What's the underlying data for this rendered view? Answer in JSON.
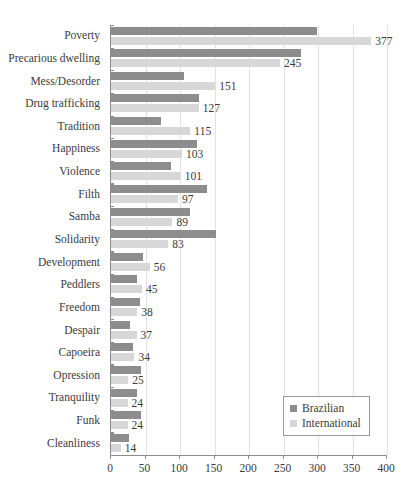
{
  "chart_data": {
    "type": "bar",
    "orientation": "horizontal",
    "title": "",
    "xlabel": "",
    "ylabel": "",
    "xlim": [
      0,
      400
    ],
    "xticks": [
      0,
      50,
      100,
      150,
      200,
      250,
      300,
      350,
      400
    ],
    "grid": true,
    "legend_position": "bottom-right",
    "categories": [
      "Poverty",
      "Precarious dwelling",
      "Mess/Desorder",
      "Drug trafficking",
      "Tradition",
      "Happiness",
      "Violence",
      "Filth",
      "Samba",
      "Solidarity",
      "Development",
      "Peddlers",
      "Freedom",
      "Despair",
      "Capoeira",
      "Opression",
      "Tranquility",
      "Funk",
      "Cleanliness"
    ],
    "series": [
      {
        "name": "Brazilian",
        "color": "#8d8d8d",
        "values": [
          298,
          275,
          106,
          128,
          73,
          125,
          87,
          139,
          115,
          152,
          46,
          38,
          42,
          27,
          32,
          43,
          37,
          44,
          26
        ]
      },
      {
        "name": "International",
        "color": "#d7d7d7",
        "values": [
          377,
          245,
          151,
          127,
          115,
          103,
          101,
          97,
          89,
          83,
          56,
          45,
          38,
          37,
          34,
          25,
          24,
          24,
          14
        ]
      }
    ],
    "data_labels": {
      "series": "International",
      "values": [
        "377",
        "245",
        "151",
        "127",
        "115",
        "103",
        "101",
        "97",
        "89",
        "83",
        "56",
        "45",
        "38",
        "37",
        "34",
        "25",
        "24",
        "24",
        "14"
      ]
    },
    "axis_color": "#8c8c8c",
    "grid_color": "#e2e2e2",
    "text_color": "#3b3b3b"
  },
  "legend": {
    "items": [
      {
        "label": "Brazilian",
        "color": "#8d8d8d"
      },
      {
        "label": "International",
        "color": "#d7d7d7"
      }
    ]
  }
}
